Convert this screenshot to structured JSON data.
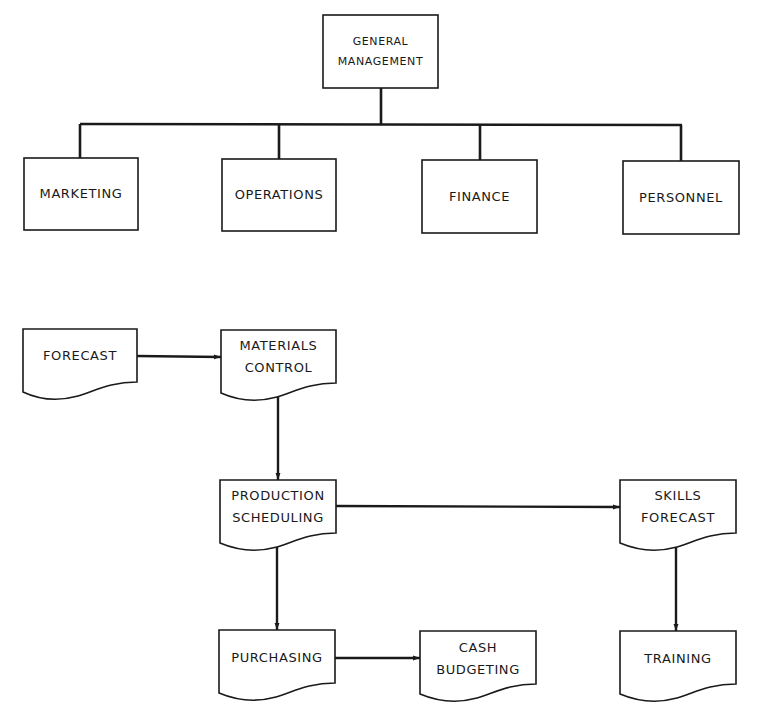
{
  "colors": {
    "ink": "#1a1a1a",
    "paper": "#ffffff"
  },
  "org_chart": {
    "root": {
      "id": "general-management",
      "lines": [
        "GENERAL",
        "MANAGEMENT"
      ]
    },
    "children": [
      {
        "id": "marketing",
        "lines": [
          "MARKETING"
        ]
      },
      {
        "id": "operations",
        "lines": [
          "OPERATIONS"
        ]
      },
      {
        "id": "finance",
        "lines": [
          "FINANCE"
        ]
      },
      {
        "id": "personnel",
        "lines": [
          "PERSONNEL"
        ]
      }
    ]
  },
  "flow_chart": {
    "nodes": [
      {
        "id": "forecast",
        "lines": [
          "FORECAST"
        ]
      },
      {
        "id": "materials-control",
        "lines": [
          "MATERIALS",
          "CONTROL"
        ]
      },
      {
        "id": "production-scheduling",
        "lines": [
          "PRODUCTION",
          "SCHEDULING"
        ]
      },
      {
        "id": "skills-forecast",
        "lines": [
          "SKILLS",
          "FORECAST"
        ]
      },
      {
        "id": "purchasing",
        "lines": [
          "PURCHASING"
        ]
      },
      {
        "id": "cash-budgeting",
        "lines": [
          "CASH",
          "BUDGETING"
        ]
      },
      {
        "id": "training",
        "lines": [
          "TRAINING"
        ]
      }
    ],
    "edges": [
      {
        "from": "forecast",
        "to": "materials-control"
      },
      {
        "from": "materials-control",
        "to": "production-scheduling"
      },
      {
        "from": "production-scheduling",
        "to": "skills-forecast"
      },
      {
        "from": "production-scheduling",
        "to": "purchasing"
      },
      {
        "from": "purchasing",
        "to": "cash-budgeting"
      },
      {
        "from": "skills-forecast",
        "to": "training"
      }
    ]
  }
}
